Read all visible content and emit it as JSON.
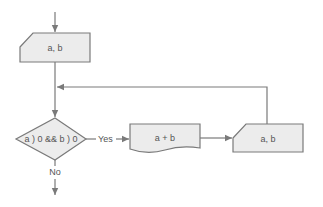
{
  "diagram": {
    "type": "flowchart",
    "colors": {
      "fill": "#ececec",
      "stroke": "#7a7a7a",
      "text": "#555555"
    },
    "nodes": {
      "input_top": {
        "shape": "manual-input",
        "label": "a, b"
      },
      "decision": {
        "shape": "diamond",
        "label": "a ) 0 && b ) 0"
      },
      "document": {
        "shape": "document",
        "label": "a + b"
      },
      "input_right": {
        "shape": "manual-input",
        "label": "a, b"
      }
    },
    "edges": {
      "yes_label": "Yes",
      "no_label": "No"
    }
  }
}
